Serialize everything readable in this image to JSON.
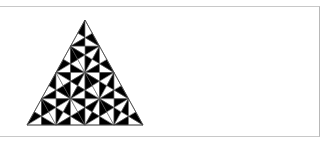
{
  "figure": {
    "rows": 4,
    "apex": [
      85,
      20
    ],
    "base_left": [
      27,
      125
    ],
    "base_right": [
      143,
      125
    ],
    "fill_color": "#000000",
    "background_color": "#ffffff",
    "line_color": "#555555",
    "frame_color": "#c8c8c8"
  }
}
